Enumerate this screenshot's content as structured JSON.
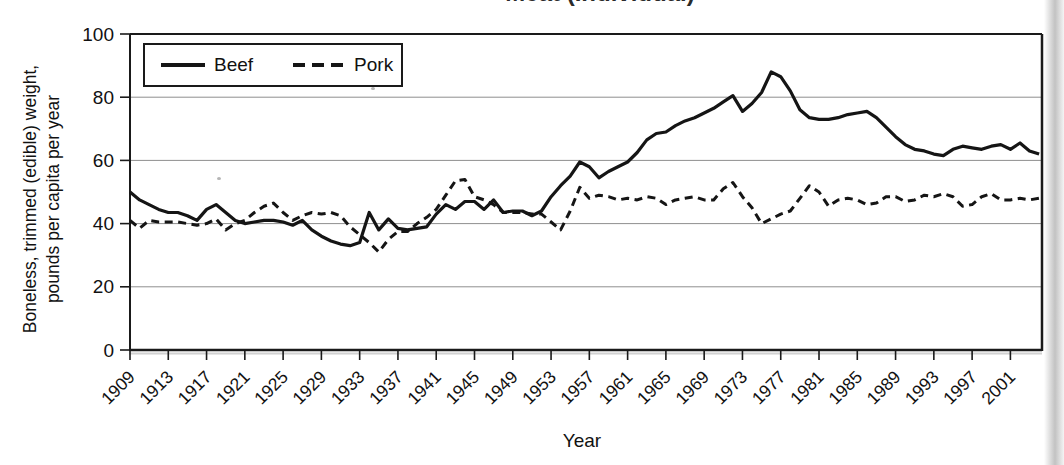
{
  "title": {
    "text": "Meat (Individual)"
  },
  "legend": {
    "items": [
      {
        "label": "Beef",
        "style": "solid"
      },
      {
        "label": "Pork",
        "style": "dashed"
      }
    ]
  },
  "y_axis": {
    "title_line1": "Boneless, trimmed (edible) weight,",
    "title_line2": "pounds per capita per year",
    "min": 0,
    "max": 100
  },
  "x_axis": {
    "title": "Year"
  },
  "colors": {
    "line": "#151515",
    "grid": "#8f8f8f",
    "axis": "#1a1a1a",
    "text": "#111111",
    "background": "#ffffff"
  },
  "chart_data": {
    "type": "line",
    "title": "Meat (Individual)",
    "xlabel": "Year",
    "ylabel": "Boneless, trimmed (edible) weight, pounds per capita per year",
    "x_start": 1909,
    "x_end": 2004,
    "x_step": 1,
    "ylim": [
      0,
      100
    ],
    "grid": true,
    "legend_position": "top-left",
    "y_ticks": [
      0,
      20,
      40,
      60,
      80,
      100
    ],
    "x_tick_years": [
      1909,
      1913,
      1917,
      1921,
      1925,
      1929,
      1933,
      1937,
      1941,
      1945,
      1949,
      1953,
      1957,
      1961,
      1965,
      1969,
      1973,
      1977,
      1981,
      1985,
      1989,
      1993,
      1997,
      2001
    ],
    "series": [
      {
        "name": "Beef",
        "line_style": "solid",
        "values": [
          50,
          47.5,
          46,
          44.5,
          43.5,
          43.5,
          42.5,
          41,
          44.5,
          46,
          43.5,
          41,
          40,
          40.5,
          41,
          41,
          40.5,
          39.5,
          41,
          38,
          36,
          34.5,
          33.5,
          33,
          34,
          43.5,
          38,
          41.5,
          38.5,
          38,
          38.5,
          39,
          43,
          46,
          44.5,
          47,
          47,
          44.5,
          47.5,
          43.5,
          44,
          44,
          42.5,
          44,
          48.5,
          52,
          55,
          59.5,
          58,
          54.5,
          56.5,
          58,
          59.5,
          62.5,
          66.5,
          68.5,
          69,
          71,
          72.5,
          73.5,
          75,
          76.5,
          78.5,
          80.5,
          75.5,
          78,
          81.5,
          88,
          86.5,
          82,
          76,
          73.5,
          73,
          73,
          73.5,
          74.5,
          75,
          75.5,
          73.5,
          70.5,
          67.5,
          65,
          63.5,
          63,
          62,
          61.5,
          63.5,
          64.5,
          64,
          63.5,
          64.5,
          65,
          63.5,
          65.5,
          63,
          62
        ]
      },
      {
        "name": "Pork",
        "line_style": "dashed",
        "values": [
          41,
          38.5,
          41,
          40.5,
          40.5,
          40.5,
          40,
          39.5,
          40,
          41.5,
          38,
          40,
          41,
          43.5,
          45.5,
          46.5,
          43.5,
          41,
          42.5,
          43.5,
          43,
          43.5,
          42.5,
          39,
          36.5,
          34,
          31,
          35,
          37.5,
          37.5,
          40,
          42,
          44.5,
          49,
          53.5,
          54,
          48.5,
          47.5,
          46,
          43.5,
          43.5,
          43.5,
          43,
          43,
          40.5,
          38,
          44,
          51.5,
          48,
          49,
          48.5,
          47.5,
          48,
          47.5,
          48.5,
          48,
          46,
          47.5,
          48,
          48.5,
          47.5,
          47.5,
          51,
          53,
          48.5,
          45,
          40,
          41.5,
          43,
          44,
          48,
          52,
          50,
          45.5,
          47.5,
          48,
          47.5,
          46,
          46.5,
          48.5,
          48.5,
          47,
          47.5,
          49,
          48.5,
          49.5,
          48.5,
          45.5,
          46,
          48.5,
          49.5,
          47.5,
          47.5,
          48,
          47.5,
          48
        ]
      }
    ]
  }
}
